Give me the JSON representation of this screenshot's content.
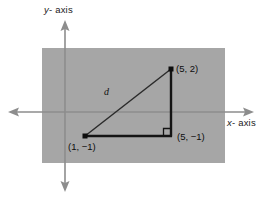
{
  "diagram": {
    "kind": "coordinate-plane-right-triangle",
    "axes": {
      "y_label_prefix": "y",
      "y_label": "y - axis",
      "x_label_prefix": "x",
      "x_label": "x - axis"
    },
    "points": [
      {
        "id": "p1",
        "label": "(1, −1)",
        "x": 1,
        "y": -1,
        "px": 85,
        "py": 136
      },
      {
        "id": "p2",
        "label": "(5, 2)",
        "x": 5,
        "y": 2,
        "px": 171,
        "py": 69
      },
      {
        "id": "p3",
        "label": "(5, −1)",
        "x": 5,
        "y": -1,
        "px": 171,
        "py": 136
      }
    ],
    "segments": {
      "hypotenuse_label": "d",
      "right_angle_at": "(5, −1)"
    },
    "colors": {
      "background": "#ffffff",
      "plane_fill": "#a6a6a6",
      "axis_stroke": "#8d8d8d",
      "triangle_stroke": "#1a1a1a",
      "hypotenuse_stroke": "#2b2b2b",
      "text": "#111111"
    }
  }
}
